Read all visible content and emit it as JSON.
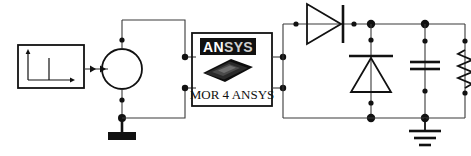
{
  "diagram": {
    "background_color": "#ffffff",
    "wire_color": "#3a3a3a",
    "component_color": "#111111",
    "width": 471,
    "height": 156
  },
  "source_block": {
    "name": "input-signal-block",
    "icon": "impulse-waveform-icon",
    "description": "Rectangular block containing plot axes with a single impulse spike"
  },
  "signal_arrow": {
    "name": "signal-flow-arrow",
    "icon": "double-arrowhead-icon",
    "description": "Horizontal connector with two arrowheads pointing right"
  },
  "voltage_source": {
    "name": "voltage-source",
    "icon": "circle-source-icon",
    "description": "Circular independent source symbol"
  },
  "source_ground": {
    "name": "source-ground-terminal",
    "icon": "filled-bar-ground-icon",
    "description": "Thick filled horizontal bar terminal"
  },
  "mor_block": {
    "name": "mor-4-ansys-block",
    "logo": {
      "brand_bright": "AN",
      "brand_dim": "SYS",
      "full_brand": "ANSYS",
      "chip_icon": "tilted-chip-icon"
    },
    "caption": "MOR 4 ANSYS",
    "terminals": {
      "top_left": "input-positive",
      "bottom_left": "input-negative",
      "top_right": "output-positive",
      "bottom_right": "output-negative"
    }
  },
  "components": [
    {
      "name": "series-diode",
      "type": "diode",
      "icon": "diode-icon",
      "orientation": "horizontal",
      "direction": "right"
    },
    {
      "name": "shunt-diode",
      "type": "diode",
      "icon": "diode-icon",
      "orientation": "vertical",
      "direction": "up"
    },
    {
      "name": "smoothing-capacitor",
      "type": "capacitor",
      "icon": "capacitor-icon",
      "orientation": "vertical"
    },
    {
      "name": "load-resistor",
      "type": "resistor",
      "icon": "resistor-zigzag-icon",
      "orientation": "vertical"
    },
    {
      "name": "output-ground",
      "type": "ground",
      "icon": "earth-ground-icon",
      "bars": 3
    }
  ],
  "nodes": {
    "count": 16,
    "marker": "junction-dot"
  }
}
